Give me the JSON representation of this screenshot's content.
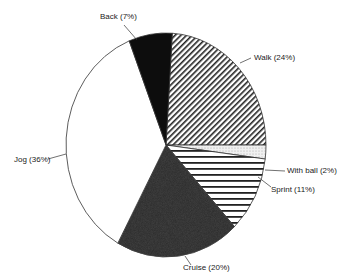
{
  "chart_data": {
    "type": "pie",
    "title": "",
    "start_angle_deg": 3.6,
    "direction": "clockwise",
    "slices": [
      {
        "label": "Walk",
        "value": 24,
        "display": "Walk (24%)",
        "fill": "diag-hatch"
      },
      {
        "label": "With ball",
        "value": 2,
        "display": "With ball (2%)",
        "fill": "light-dots"
      },
      {
        "label": "Sprint",
        "value": 11,
        "display": "Sprint (11%)",
        "fill": "horiz-stripes"
      },
      {
        "label": "Cruise",
        "value": 20,
        "display": "Cruise (20%)",
        "fill": "dark-stipple"
      },
      {
        "label": "Jog",
        "value": 36,
        "display": "Jog (36%)",
        "fill": "white"
      },
      {
        "label": "Back",
        "value": 7,
        "display": "Back (7%)",
        "fill": "black"
      }
    ],
    "legend": "none (callout labels)"
  },
  "labels": {
    "walk": "Walk (24%)",
    "with_ball": "With ball (2%)",
    "sprint": "Sprint (11%)",
    "cruise": "Cruise (20%)",
    "jog": "Jog (36%)",
    "back": "Back (7%)"
  },
  "colors": {
    "ink": "#111111",
    "stipple": "#2a2a2a",
    "light": "#e8e8e8",
    "background": "#ffffff"
  }
}
